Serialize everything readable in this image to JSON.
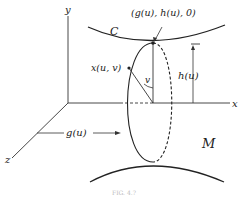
{
  "diagram": {
    "axes": {
      "x_label": "x",
      "y_label": "y",
      "z_label": "z"
    },
    "curve_label": "C",
    "surface_label": "M",
    "point_label": "(g(u), h(u), 0)",
    "surface_point_label": "x(u, v)",
    "angle_label": "v",
    "height_label": "h(u)",
    "distance_label": "g(u)",
    "caption": "FIG. 4.?"
  },
  "colors": {
    "line": "#333333",
    "text": "#222222",
    "background": "#ffffff"
  }
}
